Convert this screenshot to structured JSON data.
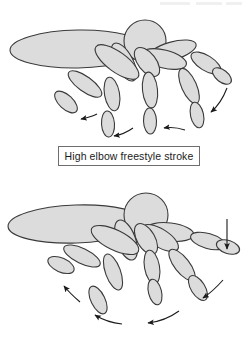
{
  "page": {
    "background_color": "#ffffff",
    "width": 246,
    "height": 344
  },
  "style": {
    "limb_fill": "#dcdcdc",
    "limb_stroke": "#3a3a3a",
    "body_fill": "#d9d9d9",
    "arrow_color": "#1a1a1a",
    "caption_border": "#6e6e6e",
    "caption_text_color": "#1a1a1a"
  },
  "figures": [
    {
      "id": "high-elbow-freestyle",
      "caption": "High elbow freestyle stroke",
      "description": "Stick-figure swimmer seen from front with four sequential arm positions showing a bent, high-elbow underwater pull path",
      "arrow_count": 3,
      "arrow_style": "curved",
      "parts": [
        "head",
        "torso",
        "arm-position-1",
        "arm-position-2",
        "arm-position-3",
        "arm-position-4"
      ]
    },
    {
      "id": "straight-arm",
      "caption": "Straight arm stroke",
      "description": "Stick-figure swimmer seen from front with four sequential arm positions showing a straight, extended underwater pull path",
      "arrow_count": 4,
      "arrow_style": "curved-plus-vertical",
      "parts": [
        "head",
        "torso",
        "arm-position-1",
        "arm-position-2",
        "arm-position-3",
        "arm-position-4"
      ]
    }
  ],
  "captions": {
    "top": "High elbow freestyle stroke",
    "bottom": "Straight arm stroke"
  }
}
